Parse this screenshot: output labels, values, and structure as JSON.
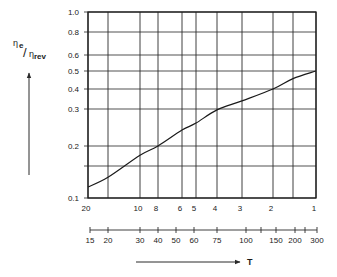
{
  "chart_data": {
    "type": "line",
    "title": "",
    "ylabel": "η_e/η_rev",
    "ylabel_parts": {
      "numerator": "η",
      "numerator_sub": "e",
      "slash": "/",
      "denominator": "η",
      "denominator_sub": "rev"
    },
    "xlabel": "T",
    "yscale": "log",
    "ylim": [
      0.1,
      1.0
    ],
    "grid": true,
    "y_ticks": [
      1.0,
      0.8,
      0.6,
      0.5,
      0.4,
      0.3,
      0.2,
      0.15,
      0.1
    ],
    "y_tick_labels": [
      "1.0",
      "0.8",
      "0.6",
      "0.5",
      "0.4",
      "0.3",
      "0.2",
      "",
      "0.1"
    ],
    "x_ratio_ticks": [
      20,
      15,
      10,
      8,
      6,
      5,
      4,
      3,
      2,
      1.5,
      1
    ],
    "x_ratio_labels": [
      "20",
      "",
      "10",
      "8",
      "6",
      "5",
      "4",
      "3",
      "2",
      "",
      "1"
    ],
    "x_T_ticks": [
      15,
      20,
      30,
      40,
      50,
      60,
      75,
      100,
      125,
      150,
      200,
      250,
      300
    ],
    "x_T_labels": [
      "15",
      "20",
      "30",
      "40",
      "50",
      "60",
      "75",
      "100",
      "",
      "150",
      "200",
      "",
      "300"
    ],
    "series": [
      {
        "name": "η_e/η_rev",
        "x_ratio": [
          20,
          15,
          10,
          8,
          6,
          5,
          4,
          3,
          2,
          1.5,
          1
        ],
        "T": [
          15,
          20,
          30,
          40,
          50,
          60,
          75,
          100,
          150,
          200,
          300
        ],
        "values": [
          0.115,
          0.13,
          0.175,
          0.2,
          0.238,
          0.257,
          0.297,
          0.337,
          0.4,
          0.455,
          0.5
        ]
      }
    ]
  }
}
